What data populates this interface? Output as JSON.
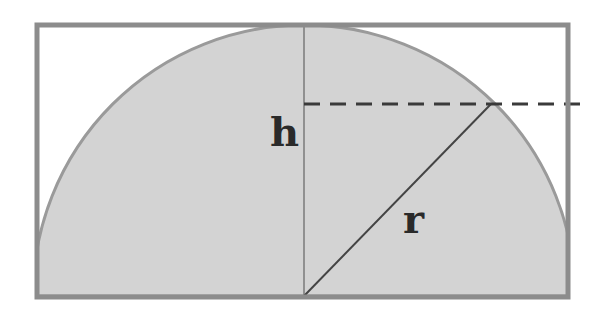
{
  "diagram": {
    "labels": {
      "height": "h",
      "radius": "r"
    },
    "colors": {
      "fill": "#d3d3d3",
      "stroke": "#8c8c8c",
      "line": "#555555",
      "dash": "#3a3a3a",
      "text": "#2a2a2a",
      "background": "#ffffff"
    },
    "geometry": {
      "box": {
        "x": 37,
        "y": 25,
        "width": 531,
        "height": 272
      },
      "circle_center": {
        "x": 304,
        "y": 296
      },
      "radius_px": 271,
      "intersection_point": {
        "x": 491,
        "y": 104
      },
      "dashed_line": {
        "y": 104,
        "x_start": 304,
        "x_end": 586
      }
    }
  }
}
